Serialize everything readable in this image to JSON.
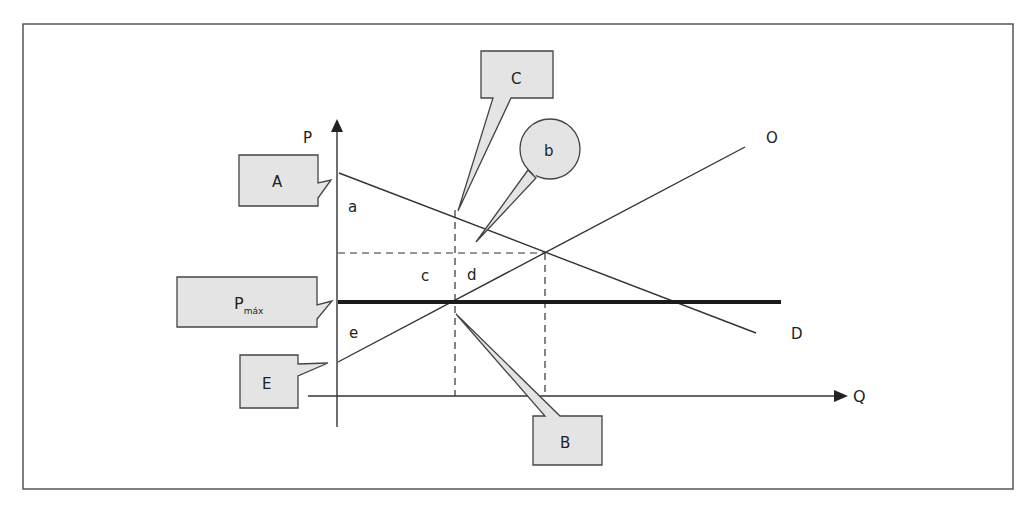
{
  "diagram": {
    "type": "supply-demand price ceiling",
    "axes": {
      "y_label": "P",
      "x_label": "Q"
    },
    "curves": {
      "supply_label": "O",
      "demand_label": "D",
      "price_ceiling_label": "P",
      "price_ceiling_subscript": "máx"
    },
    "area_labels": {
      "a": "a",
      "c": "c",
      "d": "d",
      "e": "e"
    },
    "callouts": {
      "A": "A",
      "B": "B",
      "C": "C",
      "b": "b",
      "E": "E",
      "Pmax_main": "P",
      "Pmax_sub": "máx"
    },
    "colors": {
      "line": "#333333",
      "callout_fill": "#e4e4e4",
      "frame": "#555555"
    }
  }
}
